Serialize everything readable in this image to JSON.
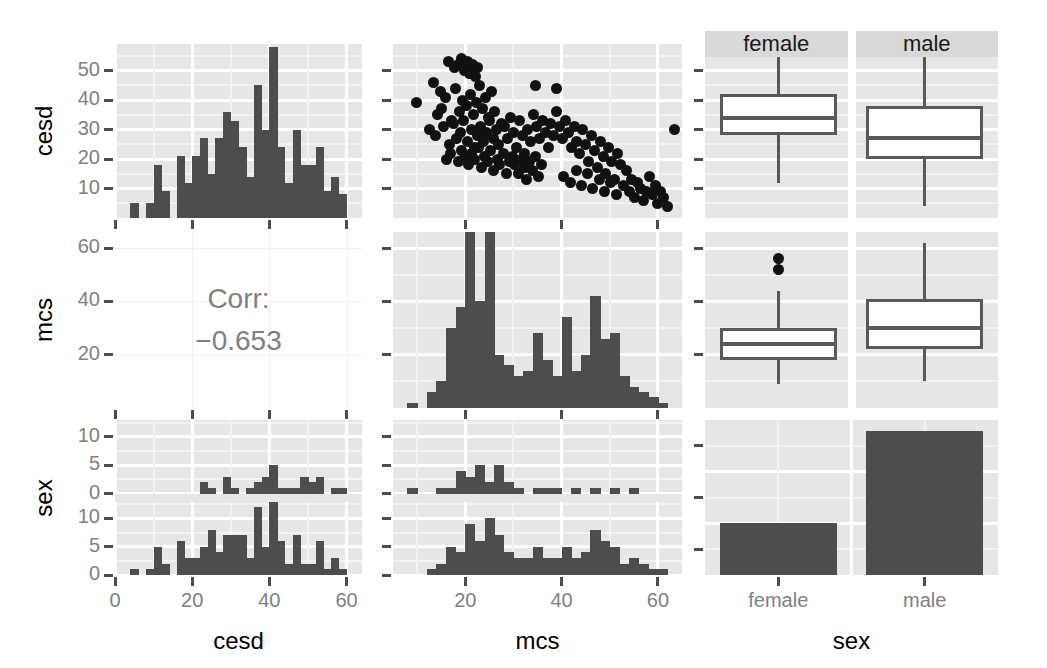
{
  "chart_data": {
    "type": "scatter",
    "title": "",
    "subtitle": "",
    "plot_kind": "scatterplot-matrix (ggpairs)",
    "variables": [
      "cesd",
      "mcs",
      "sex"
    ],
    "axis_titles": {
      "row1": "cesd",
      "row2": "mcs",
      "row3": "sex",
      "col1": "cesd",
      "col2": "mcs",
      "col3": "sex"
    },
    "grid": true,
    "legend": "none",
    "panels": [
      {
        "id": "cesd-hist",
        "row": 1,
        "col": 1,
        "type": "bar",
        "xlabel": "cesd",
        "ylabel": "cesd",
        "xlim": [
          0,
          64
        ],
        "ylim": [
          0,
          59
        ],
        "xticks": [
          0,
          20,
          40,
          60
        ],
        "yticks": [
          10,
          20,
          30,
          40,
          50
        ],
        "bin_width": 2,
        "bin_starts": [
          4,
          6,
          8,
          10,
          12,
          14,
          16,
          18,
          20,
          22,
          24,
          26,
          28,
          30,
          32,
          34,
          36,
          38,
          40,
          42,
          44,
          46,
          48,
          50,
          52,
          54,
          56,
          58
        ],
        "values": [
          5,
          0,
          5,
          18,
          9,
          0,
          21,
          12,
          21,
          27,
          15,
          27,
          36,
          33,
          24,
          14,
          45,
          30,
          58,
          24,
          12,
          30,
          18,
          18,
          24,
          9,
          14,
          8
        ]
      },
      {
        "id": "cesd-vs-mcs-scatter",
        "row": 1,
        "col": 2,
        "type": "scatter",
        "xlabel": "mcs",
        "ylabel": "cesd",
        "xlim": [
          5,
          65
        ],
        "ylim": [
          0,
          59
        ],
        "xticks": [
          20,
          40,
          60
        ],
        "yticks": [
          10,
          20,
          30,
          40,
          50
        ],
        "n_points": 150,
        "points": [
          [
            9.9,
            39
          ],
          [
            13.4,
            46
          ],
          [
            14.9,
            43
          ],
          [
            16.5,
            53
          ],
          [
            17.8,
            51
          ],
          [
            18.5,
            52
          ],
          [
            19.2,
            54
          ],
          [
            19.8,
            50
          ],
          [
            20.4,
            53
          ],
          [
            20.9,
            49
          ],
          [
            21.5,
            52
          ],
          [
            22.1,
            48
          ],
          [
            22.6,
            51
          ],
          [
            14.2,
            35
          ],
          [
            15.1,
            37
          ],
          [
            16.0,
            41
          ],
          [
            17.2,
            33
          ],
          [
            18.0,
            44
          ],
          [
            18.8,
            36
          ],
          [
            19.5,
            40
          ],
          [
            20.2,
            38
          ],
          [
            21.0,
            42
          ],
          [
            21.7,
            35
          ],
          [
            22.3,
            39
          ],
          [
            23.0,
            45
          ],
          [
            23.6,
            37
          ],
          [
            24.2,
            41
          ],
          [
            24.8,
            34
          ],
          [
            25.4,
            43
          ],
          [
            26.0,
            36
          ],
          [
            12.5,
            30
          ],
          [
            13.8,
            28
          ],
          [
            15.5,
            31
          ],
          [
            16.8,
            25
          ],
          [
            17.5,
            32
          ],
          [
            18.2,
            27
          ],
          [
            19.0,
            29
          ],
          [
            19.6,
            33
          ],
          [
            20.5,
            26
          ],
          [
            21.2,
            30
          ],
          [
            21.9,
            24
          ],
          [
            22.5,
            28
          ],
          [
            23.2,
            31
          ],
          [
            23.8,
            26
          ],
          [
            24.5,
            29
          ],
          [
            25.1,
            33
          ],
          [
            25.8,
            27
          ],
          [
            26.4,
            30
          ],
          [
            27.0,
            25
          ],
          [
            27.6,
            32
          ],
          [
            16.2,
            20
          ],
          [
            17.0,
            22
          ],
          [
            18.6,
            19
          ],
          [
            19.3,
            23
          ],
          [
            20.0,
            21
          ],
          [
            20.7,
            18
          ],
          [
            21.4,
            22
          ],
          [
            22.0,
            20
          ],
          [
            22.8,
            24
          ],
          [
            23.4,
            17
          ],
          [
            24.0,
            21
          ],
          [
            24.6,
            19
          ],
          [
            25.2,
            23
          ],
          [
            25.9,
            16
          ],
          [
            26.6,
            20
          ],
          [
            27.2,
            18
          ],
          [
            27.9,
            22
          ],
          [
            28.5,
            15
          ],
          [
            29.1,
            19
          ],
          [
            29.8,
            21
          ],
          [
            28.2,
            31
          ],
          [
            28.8,
            27
          ],
          [
            29.4,
            34
          ],
          [
            30.0,
            29
          ],
          [
            30.6,
            24
          ],
          [
            31.2,
            33
          ],
          [
            31.8,
            28
          ],
          [
            32.4,
            22
          ],
          [
            33.0,
            30
          ],
          [
            33.6,
            26
          ],
          [
            34.2,
            35
          ],
          [
            34.8,
            31
          ],
          [
            35.4,
            27
          ],
          [
            36.0,
            33
          ],
          [
            36.6,
            29
          ],
          [
            37.2,
            24
          ],
          [
            37.8,
            32
          ],
          [
            38.4,
            28
          ],
          [
            39.0,
            36
          ],
          [
            39.6,
            31
          ],
          [
            30.3,
            18
          ],
          [
            31.0,
            15
          ],
          [
            31.6,
            20
          ],
          [
            32.2,
            17
          ],
          [
            32.8,
            13
          ],
          [
            33.4,
            19
          ],
          [
            34.0,
            16
          ],
          [
            34.6,
            21
          ],
          [
            35.2,
            14
          ],
          [
            35.8,
            18
          ],
          [
            40.2,
            27
          ],
          [
            40.8,
            33
          ],
          [
            41.4,
            29
          ],
          [
            42.0,
            24
          ],
          [
            42.6,
            31
          ],
          [
            43.2,
            26
          ],
          [
            43.8,
            22
          ],
          [
            44.4,
            30
          ],
          [
            45.0,
            25
          ],
          [
            45.6,
            19
          ],
          [
            46.2,
            28
          ],
          [
            46.8,
            23
          ],
          [
            47.4,
            17
          ],
          [
            48.0,
            26
          ],
          [
            48.6,
            21
          ],
          [
            49.2,
            15
          ],
          [
            49.8,
            24
          ],
          [
            50.4,
            19
          ],
          [
            51.0,
            13
          ],
          [
            51.6,
            22
          ],
          [
            40.5,
            14
          ],
          [
            41.8,
            12
          ],
          [
            43.0,
            16
          ],
          [
            44.2,
            11
          ],
          [
            45.4,
            15
          ],
          [
            46.5,
            10
          ],
          [
            47.8,
            13
          ],
          [
            49.0,
            9
          ],
          [
            50.2,
            12
          ],
          [
            51.4,
            8
          ],
          [
            52.2,
            18
          ],
          [
            52.8,
            11
          ],
          [
            53.4,
            16
          ],
          [
            54.0,
            9
          ],
          [
            54.6,
            13
          ],
          [
            55.2,
            7
          ],
          [
            55.8,
            12
          ],
          [
            56.4,
            10
          ],
          [
            57.0,
            6
          ],
          [
            57.6,
            9
          ],
          [
            58.2,
            14
          ],
          [
            58.8,
            8
          ],
          [
            59.4,
            11
          ],
          [
            60.0,
            5
          ],
          [
            60.6,
            9
          ],
          [
            61.2,
            7
          ],
          [
            62.0,
            4
          ],
          [
            63.5,
            30
          ],
          [
            39.0,
            44
          ],
          [
            34.5,
            45
          ]
        ]
      },
      {
        "id": "cesd-by-sex-box",
        "row": 1,
        "col": 3,
        "type": "boxplot",
        "xlabel": "sex",
        "ylabel": "cesd",
        "categories": [
          "female",
          "male"
        ],
        "ylim": [
          0,
          59
        ],
        "yticks": [
          10,
          20,
          30,
          40,
          50
        ],
        "boxes": [
          {
            "group": "female",
            "lower_whisker": 12,
            "q1": 28,
            "median": 34,
            "q3": 42,
            "upper_whisker": 55,
            "outliers": []
          },
          {
            "group": "male",
            "lower_whisker": 4,
            "q1": 20,
            "median": 27,
            "q3": 38,
            "upper_whisker": 55,
            "outliers": []
          }
        ]
      },
      {
        "id": "corr-cesd-mcs",
        "row": 2,
        "col": 1,
        "type": "text",
        "label": "Corr:",
        "value": "−0.653",
        "correlation": -0.653
      },
      {
        "id": "mcs-hist",
        "row": 2,
        "col": 2,
        "type": "bar",
        "xlabel": "mcs",
        "ylabel": "mcs",
        "xlim": [
          5,
          65
        ],
        "ylim": [
          0,
          66
        ],
        "xticks": [
          20,
          40,
          60
        ],
        "yticks": [
          20,
          40,
          60
        ],
        "bin_width": 2,
        "bin_starts": [
          8,
          10,
          12,
          14,
          16,
          18,
          20,
          22,
          24,
          26,
          28,
          30,
          32,
          34,
          36,
          38,
          40,
          42,
          44,
          46,
          48,
          50,
          52,
          54,
          56,
          58,
          60,
          62
        ],
        "values": [
          2,
          0,
          6,
          10,
          30,
          38,
          66,
          40,
          66,
          20,
          16,
          12,
          14,
          28,
          18,
          12,
          34,
          14,
          20,
          42,
          26,
          28,
          12,
          8,
          6,
          4,
          2,
          0
        ]
      },
      {
        "id": "mcs-by-sex-box",
        "row": 2,
        "col": 3,
        "type": "boxplot",
        "xlabel": "sex",
        "ylabel": "mcs",
        "categories": [
          "female",
          "male"
        ],
        "ylim": [
          0,
          66
        ],
        "yticks": [
          20,
          40,
          60
        ],
        "boxes": [
          {
            "group": "female",
            "lower_whisker": 9,
            "q1": 18,
            "median": 24,
            "q3": 30,
            "upper_whisker": 44,
            "outliers": [
              52,
              56
            ]
          },
          {
            "group": "male",
            "lower_whisker": 10,
            "q1": 22,
            "median": 30,
            "q3": 41,
            "upper_whisker": 62,
            "outliers": []
          }
        ]
      },
      {
        "id": "cesd-by-sex-facet-hist",
        "row": 3,
        "col": 1,
        "type": "bar",
        "xlabel": "cesd",
        "ylabel": "sex",
        "facets": [
          "female",
          "male"
        ],
        "xlim": [
          0,
          64
        ],
        "ylim": [
          0,
          13
        ],
        "yticks": [
          0,
          5,
          10
        ],
        "xticks": [
          0,
          20,
          40,
          60
        ],
        "bin_width": 2,
        "bin_starts": [
          4,
          6,
          8,
          10,
          12,
          14,
          16,
          18,
          20,
          22,
          24,
          26,
          28,
          30,
          32,
          34,
          36,
          38,
          40,
          42,
          44,
          46,
          48,
          50,
          52,
          54,
          56,
          58
        ],
        "female_values": [
          0,
          0,
          0,
          0,
          0,
          0,
          0,
          0,
          0,
          2,
          1,
          0,
          3,
          1,
          0,
          1,
          2,
          3,
          5,
          1,
          1,
          1,
          3,
          2,
          3,
          0,
          1,
          1
        ],
        "male_values": [
          1,
          0,
          1,
          5,
          2,
          0,
          6,
          3,
          3,
          5,
          8,
          4,
          7,
          7,
          7,
          3,
          12,
          5,
          13,
          6,
          2,
          7,
          2,
          2,
          6,
          1,
          3,
          1
        ]
      },
      {
        "id": "mcs-by-sex-facet-hist",
        "row": 3,
        "col": 2,
        "type": "bar",
        "xlabel": "mcs",
        "ylabel": "sex",
        "facets": [
          "female",
          "male"
        ],
        "xlim": [
          5,
          65
        ],
        "ylim": [
          0,
          13
        ],
        "yticks": [
          0,
          5,
          10
        ],
        "xticks": [
          20,
          40,
          60
        ],
        "bin_width": 2,
        "bin_starts": [
          8,
          10,
          12,
          14,
          16,
          18,
          20,
          22,
          24,
          26,
          28,
          30,
          32,
          34,
          36,
          38,
          40,
          42,
          44,
          46,
          48,
          50,
          52,
          54,
          56,
          58,
          60,
          62
        ],
        "female_values": [
          1,
          0,
          0,
          1,
          1,
          4,
          3,
          5,
          2,
          5,
          2,
          1,
          0,
          1,
          1,
          1,
          0,
          1,
          0,
          1,
          0,
          1,
          0,
          1,
          0,
          0,
          0,
          0
        ],
        "male_values": [
          0,
          0,
          1,
          2,
          5,
          4,
          9,
          6,
          10,
          7,
          4,
          3,
          3,
          5,
          3,
          3,
          5,
          3,
          4,
          8,
          6,
          5,
          2,
          3,
          2,
          1,
          1,
          0
        ]
      },
      {
        "id": "sex-bar",
        "row": 3,
        "col": 3,
        "type": "bar",
        "xlabel": "sex",
        "ylabel": "sex",
        "categories": [
          "female",
          "male"
        ],
        "values": [
          36,
          100
        ],
        "ylim": [
          0,
          108
        ]
      }
    ],
    "strip_labels": [
      "female",
      "male"
    ],
    "row_axis_labels": [
      "cesd",
      "mcs",
      "sex"
    ],
    "col_axis_labels": [
      "cesd",
      "mcs",
      "sex"
    ],
    "tick_labels": {
      "cesd_y": [
        "10",
        "20",
        "30",
        "40",
        "50"
      ],
      "mcs_y": [
        "20",
        "40",
        "60"
      ],
      "sex_y": [
        "0",
        "5",
        "10",
        "0",
        "5",
        "10"
      ],
      "cesd_x": [
        "0",
        "20",
        "40",
        "60"
      ],
      "mcs_x": [
        "20",
        "40",
        "60"
      ],
      "sex_x": [
        "female",
        "male"
      ]
    },
    "colors": {
      "panel_background": "#e6e6e6",
      "grid_line": "#ffffff",
      "bar_fill": "#4d4d4d",
      "point_fill": "#111111",
      "box_stroke": "#595959",
      "box_fill": "#ffffff",
      "strip_background": "#d9d9d9",
      "tick_label": "#808080",
      "axis_title": "#000000",
      "corr_text": "#808080"
    }
  }
}
